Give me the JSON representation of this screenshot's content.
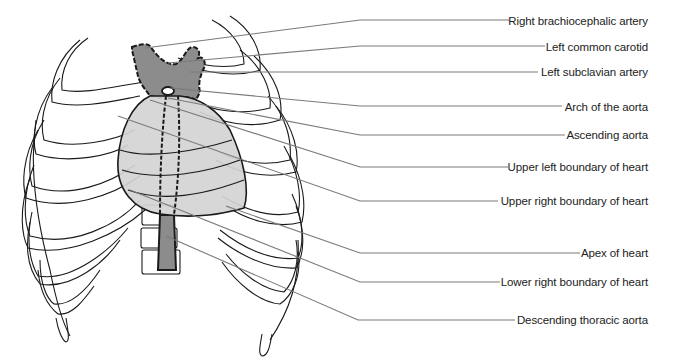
{
  "figure": {
    "colors": {
      "vessel": "#8c8c8c",
      "heart": "#d4d4d4",
      "outline": "#1a1a1a",
      "leader": "#7a7a7a",
      "label_text": "#222222"
    }
  },
  "labels": [
    {
      "id": "right-brachiocephalic-artery",
      "text": "Right brachiocephalic artery",
      "y": 14
    },
    {
      "id": "left-common-carotid",
      "text": "Left common carotid",
      "y": 40
    },
    {
      "id": "left-subclavian-artery",
      "text": "Left subclavian artery",
      "y": 65
    },
    {
      "id": "arch-of-the-aorta",
      "text": "Arch of the aorta",
      "y": 100
    },
    {
      "id": "ascending-aorta",
      "text": "Ascending aorta",
      "y": 128
    },
    {
      "id": "upper-left-boundary-of-heart",
      "text": "Upper left boundary of heart",
      "y": 160
    },
    {
      "id": "upper-right-boundary-of-heart",
      "text": "Upper right boundary of heart",
      "y": 194
    },
    {
      "id": "apex-of-heart",
      "text": "Apex of heart",
      "y": 246
    },
    {
      "id": "lower-right-boundary-of-heart",
      "text": "Lower right boundary of heart",
      "y": 275
    },
    {
      "id": "descending-thoracic-aorta",
      "text": "Descending thoracic aorta",
      "y": 313
    }
  ]
}
